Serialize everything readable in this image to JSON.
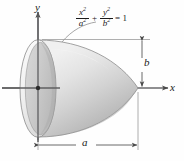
{
  "figure": {
    "background_color": "#fefefe",
    "axes": {
      "x_label": "x",
      "y_label": "y",
      "axis_color": "#58585a",
      "origin": {
        "x": 38,
        "y": 88
      }
    },
    "equation": {
      "x_numerator": "x",
      "x_numerator_exp": "2",
      "x_denominator": "a",
      "x_denominator_exp": "2",
      "operator": "+",
      "y_numerator": "y",
      "y_numerator_exp": "2",
      "y_denominator": "b",
      "y_denominator_exp": "2",
      "equals": "= 1",
      "plain_text": "x²/a² + y²/b² = 1"
    },
    "dimensions": [
      {
        "name": "b",
        "label": "b",
        "orientation": "vertical",
        "position": "right"
      },
      {
        "name": "a",
        "label": "a",
        "orientation": "horizontal",
        "position": "bottom"
      }
    ],
    "solid": {
      "name": "semi-ellipsoid",
      "fill_light": "#ebebeb",
      "fill_mid": "#d4d4d4",
      "fill_dark": "#b2b2b2",
      "base_face_fill": "#c9c9c9",
      "outline_color": "#7a7a7a",
      "semi_axis_horizontal": "a",
      "semi_axis_vertical": "b"
    }
  }
}
